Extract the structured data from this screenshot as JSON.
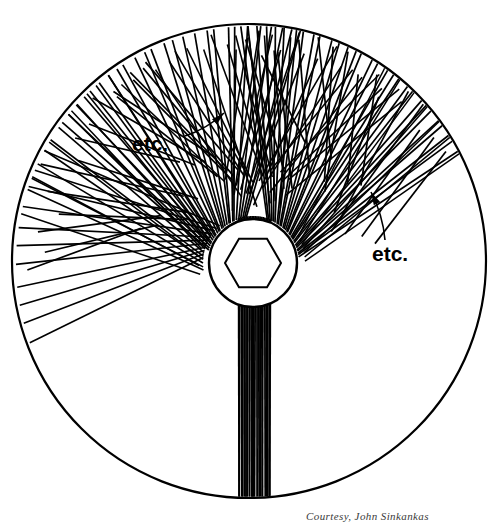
{
  "figure": {
    "name": "faceting-lap-scratch-pattern-diagram",
    "background_color": "#ffffff",
    "ink_color": "#000000"
  },
  "disc": {
    "name": "lap-disc",
    "center_x": 249,
    "center_y": 261,
    "radius": 237,
    "stroke_width": 2.2
  },
  "hub": {
    "name": "center-hub",
    "center_x": 253,
    "center_y": 263,
    "outer_radius": 44,
    "stroke_width": 2.4,
    "hexagon": {
      "name": "hex-arbor-hole",
      "radius": 28,
      "rotation_deg": 0,
      "stroke_width": 2.0
    }
  },
  "annotations": {
    "etc_1": {
      "text": "etc.",
      "x": 132,
      "y": 133
    },
    "etc_2": {
      "text": "etc.",
      "x": 372,
      "y": 243
    }
  },
  "arrows": [
    {
      "name": "arrow-upper-left",
      "from_x": 185,
      "from_y": 136,
      "to_x": 224,
      "to_y": 113,
      "curve": "slight",
      "stroke_width": 1.6
    },
    {
      "name": "arrow-right",
      "from_x": 385,
      "from_y": 240,
      "to_x": 371,
      "to_y": 192,
      "curve": "slight",
      "stroke_width": 1.6
    }
  ],
  "caption": {
    "text": "Courtesy, John Sinkankas"
  },
  "chart_data": {
    "type": "diagram",
    "elements": {
      "outer_circle": 1,
      "hub_circle": 1,
      "hexagon": 1,
      "etc_labels": 2,
      "arrows": 2
    },
    "hatch_fans": [
      {
        "name": "fan-upper-left-sparse",
        "start_angle_deg": 168,
        "end_angle_deg": 196,
        "line_count": 4,
        "stroke_width": 1.5,
        "inner_radius": 48,
        "outer_radius": 237,
        "style": "near-parallel-sweep"
      },
      {
        "name": "fan-left-crosshatch-a",
        "start_angle_deg": 172,
        "end_angle_deg": 212,
        "line_count": 11,
        "stroke_width": 1.6,
        "inner_radius": 48,
        "outer_radius": 237,
        "style": "parallel-band"
      },
      {
        "name": "fan-left-crosshatch-b",
        "start_angle_deg": 186,
        "end_angle_deg": 228,
        "line_count": 11,
        "stroke_width": 1.6,
        "inner_radius": 48,
        "outer_radius": 237,
        "style": "parallel-band-mirror"
      },
      {
        "name": "fan-lower-left",
        "start_angle_deg": 196,
        "end_angle_deg": 262,
        "line_count": 26,
        "stroke_width": 1.7,
        "inner_radius": 46,
        "outer_radius": 237,
        "style": "radial-sweep"
      },
      {
        "name": "fan-bottom-vertical",
        "start_angle_deg": 252,
        "end_angle_deg": 292,
        "line_count": 22,
        "stroke_width": 1.8,
        "inner_radius": 46,
        "outer_radius": 237,
        "style": "near-vertical"
      },
      {
        "name": "fan-lower-right",
        "start_angle_deg": 288,
        "end_angle_deg": 352,
        "line_count": 30,
        "stroke_width": 1.7,
        "inner_radius": 46,
        "outer_radius": 237,
        "style": "radial-sweep"
      },
      {
        "name": "fan-right-sparse",
        "start_angle_deg": 330,
        "end_angle_deg": 358,
        "line_count": 7,
        "stroke_width": 1.5,
        "inner_radius": 48,
        "outer_radius": 237,
        "style": "near-parallel-sweep"
      }
    ]
  }
}
